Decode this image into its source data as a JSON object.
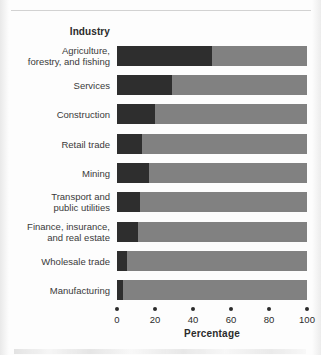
{
  "figure": {
    "column_header": "Industry",
    "axis_title": "Percentage"
  },
  "chart_data": {
    "type": "bar",
    "orientation": "horizontal",
    "stacked": true,
    "title": "",
    "subtitle": "",
    "xlabel": "Percentage",
    "ylabel": "Industry",
    "xlim": [
      0,
      100
    ],
    "xticks": [
      0,
      20,
      40,
      60,
      80,
      100
    ],
    "xtick_labels": [
      "0",
      "20",
      "40",
      "60",
      "80",
      "100"
    ],
    "grid": false,
    "legend": null,
    "categories": [
      "Agriculture, forestry, and fishing",
      "Services",
      "Construction",
      "Retail trade",
      "Mining",
      "Transport and public utilities",
      "Finance, insurance, and real estate",
      "Wholesale trade",
      "Manufacturing"
    ],
    "category_lines": [
      [
        "Agriculture,",
        "forestry, and fishing"
      ],
      [
        "Services"
      ],
      [
        "Construction"
      ],
      [
        "Retail trade"
      ],
      [
        "Mining"
      ],
      [
        "Transport and",
        "public utilities"
      ],
      [
        "Finance, insurance,",
        "and real estate"
      ],
      [
        "Wholesale trade"
      ],
      [
        "Manufacturing"
      ]
    ],
    "series": [
      {
        "name": "dark-segment",
        "color": "#2e2e2e",
        "values": [
          50,
          29,
          20,
          13,
          17,
          12,
          11,
          5,
          3
        ]
      },
      {
        "name": "light-segment",
        "color": "#818181",
        "values": [
          50,
          71,
          80,
          87,
          83,
          88,
          89,
          95,
          97
        ]
      }
    ]
  }
}
